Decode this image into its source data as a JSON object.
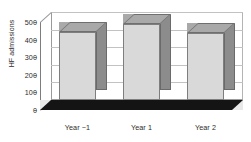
{
  "chart_data": {
    "type": "bar",
    "title": "",
    "subtitle": "",
    "xlabel": "",
    "ylabel": "HF admissions",
    "categories": [
      "Year −1",
      "Year 1",
      "Year 2"
    ],
    "values": [
      385,
      430,
      380
    ],
    "series": [
      {
        "name": "HF admissions",
        "values": [
          385,
          430,
          380
        ]
      }
    ],
    "ylim": [
      0,
      500
    ],
    "ytick_labels": [
      "0",
      "100",
      "200",
      "300",
      "400",
      "500"
    ],
    "ytick_values": [
      0,
      100,
      200,
      300,
      400,
      500
    ],
    "grid": true,
    "legend": false,
    "legend_position": "none",
    "style": "3d-column",
    "colors": {
      "bar_front": "#d9d9d9",
      "bar_side": "#8c8c8c",
      "bar_top": "#a9a9a9",
      "gridline": "#c2c2c2",
      "axis": "#7d7d7d",
      "text": "#2b2b2b",
      "floor": "#1a1a1a",
      "background": "#ffffff"
    }
  }
}
